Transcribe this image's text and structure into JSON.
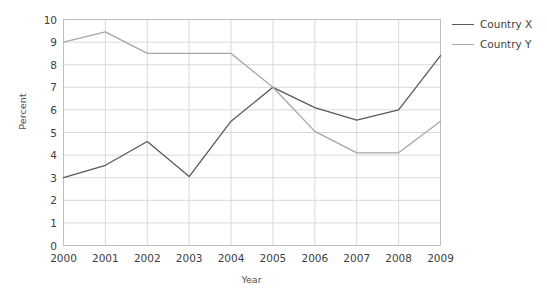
{
  "chart_data": {
    "type": "line",
    "title": "",
    "xlabel": "Year",
    "ylabel": "Percent",
    "categories": [
      "2000",
      "2001",
      "2002",
      "2003",
      "2004",
      "2005",
      "2006",
      "2007",
      "2008",
      "2009"
    ],
    "x": [
      2000,
      2001,
      2002,
      2003,
      2004,
      2005,
      2006,
      2007,
      2008,
      2009
    ],
    "xlim": [
      2000,
      2009
    ],
    "ylim": [
      0,
      10
    ],
    "ytick_labels": [
      "0",
      "1",
      "2",
      "3",
      "4",
      "5",
      "6",
      "7",
      "8",
      "9",
      "10"
    ],
    "yticks": [
      0,
      1,
      2,
      3,
      4,
      5,
      6,
      7,
      8,
      9,
      10
    ],
    "grid": true,
    "legend_position": "right",
    "series": [
      {
        "name": "Country X",
        "color": "#595959",
        "values": [
          3.0,
          3.55,
          4.6,
          3.05,
          5.5,
          7.0,
          6.1,
          5.55,
          6.0,
          8.4
        ]
      },
      {
        "name": "Country Y",
        "color": "#a6a6a6",
        "values": [
          9.0,
          9.45,
          8.5,
          8.5,
          8.5,
          7.0,
          5.05,
          4.1,
          4.1,
          5.5
        ]
      }
    ]
  },
  "legend": {
    "items": [
      {
        "label": "Country X"
      },
      {
        "label": "Country Y"
      }
    ]
  },
  "axes": {
    "y_title": "Percent",
    "x_title": "Year"
  },
  "colors": {
    "series_x": "#595959",
    "series_y": "#a6a6a6",
    "grid": "#d9d9d9",
    "frame": "#bfbfbf",
    "text": "#404040",
    "background": "#ffffff"
  }
}
